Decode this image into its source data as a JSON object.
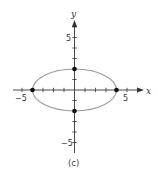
{
  "chart_data": {
    "type": "line",
    "title": "",
    "caption": "(c)",
    "xlabel": "x",
    "ylabel": "y",
    "xlim": [
      -6,
      7
    ],
    "ylim": [
      -6,
      7
    ],
    "x_tick_labels": [
      "-5",
      "5"
    ],
    "y_tick_labels": [
      "5",
      "-5"
    ],
    "tick_step": 1,
    "grid": false,
    "curve": {
      "shape": "ellipse",
      "equation": "x^2/16 + y^2/4 = 1",
      "center": [
        0,
        0
      ],
      "semi_axis_x": 4,
      "semi_axis_y": 2,
      "color": "#9a9a9a"
    },
    "points": [
      {
        "x": -4,
        "y": 0
      },
      {
        "x": 4,
        "y": 0
      },
      {
        "x": 0,
        "y": 2
      },
      {
        "x": 0,
        "y": -2
      }
    ]
  },
  "labels": {
    "x_axis": "x",
    "y_axis": "y",
    "x_neg5": "−5",
    "x_pos5": "5",
    "y_pos5": "5",
    "y_neg5": "−5",
    "caption": "(c)"
  },
  "colors": {
    "axis": "#333333",
    "curve": "#9a9a9a",
    "point": "#111111"
  }
}
